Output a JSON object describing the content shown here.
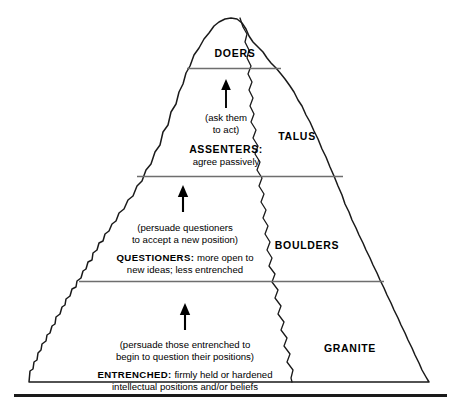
{
  "diagram": {
    "type": "pyramid-tier-diagram",
    "shape": "jagged mountain silhouette",
    "tier_count": 4,
    "colors": {
      "outline": "#1a1a1a",
      "divider": "#6e6e6e",
      "text": "#000000",
      "background": "#ffffff",
      "baseline_rule": "#1a1a1a"
    },
    "tiers": [
      {
        "id": "doers",
        "order": 1,
        "position": "summit",
        "audience_label": "DOERS",
        "audience_description": "",
        "action_note": "",
        "geology_label": ""
      },
      {
        "id": "assenters",
        "order": 2,
        "position": "upper",
        "action_note_line1": "(ask them",
        "action_note_line2": "to act)",
        "audience_label": "ASSENTERS:",
        "audience_description": "agree passively",
        "geology_label": "TALUS"
      },
      {
        "id": "questioners",
        "order": 3,
        "position": "middle",
        "action_note_line1": "(persuade questioners",
        "action_note_line2": "to accept a new position)",
        "audience_label": "QUESTIONERS:",
        "audience_description_line1": " more open to",
        "audience_description_line2": "new ideas; less entrenched",
        "geology_label": "BOULDERS"
      },
      {
        "id": "entrenched",
        "order": 4,
        "position": "base",
        "action_note_line1": "(persuade those entrenched to",
        "action_note_line2": "begin to question their positions)",
        "audience_label": "ENTRENCHED:",
        "audience_description_line1": " firmly held or hardened",
        "audience_description_line2": "intellectual positions and/or beliefs",
        "geology_label": "GRANITE"
      }
    ],
    "arrows": [
      {
        "id": "arrow-to-doers",
        "direction": "up",
        "from_tier": "assenters",
        "to_tier": "doers"
      },
      {
        "id": "arrow-to-assenters",
        "direction": "up",
        "from_tier": "questioners",
        "to_tier": "assenters"
      },
      {
        "id": "arrow-to-questioners",
        "direction": "up",
        "from_tier": "entrenched",
        "to_tier": "questioners"
      }
    ]
  }
}
